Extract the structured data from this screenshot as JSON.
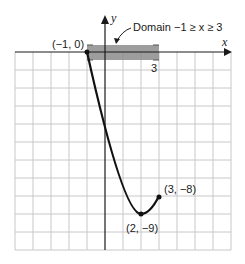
{
  "figure": {
    "annotation": "Domain −1 ≥ x ≥ 3",
    "axis_x_label": "x",
    "axis_y_label": "y",
    "domain_end_tick_label": "3",
    "points": [
      {
        "label": "(−1, 0)",
        "x": -1,
        "y": 0
      },
      {
        "label": "(2, −9)",
        "x": 2,
        "y": -9
      },
      {
        "label": "(3, −8)",
        "x": 3,
        "y": -8
      }
    ],
    "function": "y = (x − 2)² − 9",
    "grid": {
      "columns": 12,
      "rows": 11,
      "x_unit_cells": 1,
      "y_unit_cells": 0.5
    },
    "colors": {
      "grid": "#c8c8c8",
      "axis": "#1a1a1a",
      "curve": "#111111",
      "domain_bar": "#8c8c8c"
    }
  }
}
